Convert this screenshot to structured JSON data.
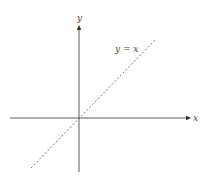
{
  "diagram": {
    "x_axis_label": "x",
    "y_axis_label": "y",
    "line_label": "y = x",
    "line_style": "dashed",
    "axis_color": "#333333",
    "line_color": "#555555"
  }
}
